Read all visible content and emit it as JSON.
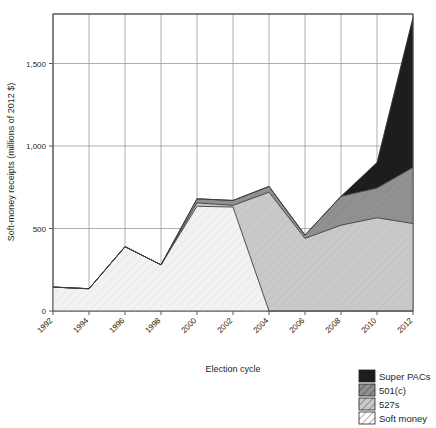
{
  "chart_data": {
    "type": "area",
    "title": "",
    "xlabel": "Election cycle",
    "ylabel": "Soft-money receipts (millions of 2012 $)",
    "categories": [
      "1992",
      "1994",
      "1996",
      "1998",
      "2000",
      "2002",
      "2004",
      "2006",
      "2008",
      "2010",
      "2012"
    ],
    "x": [
      1992,
      1994,
      1996,
      1998,
      2000,
      2002,
      2004,
      2006,
      2008,
      2010,
      2012
    ],
    "xlim": [
      1992,
      2012
    ],
    "ylim": [
      0,
      1800
    ],
    "yticks": [
      0,
      500,
      1000,
      1500
    ],
    "ytick_labels": [
      "0",
      "500",
      "1,000",
      "1,500"
    ],
    "grid": true,
    "stacked": true,
    "legend_position": "bottom-right",
    "series": [
      {
        "name": "Soft money",
        "color": "#eeeeee",
        "pattern": "diagonal-light",
        "values": [
          145,
          135,
          390,
          280,
          635,
          630,
          0,
          0,
          0,
          0,
          0
        ]
      },
      {
        "name": "527s",
        "color": "#c8c8c8",
        "pattern": "diagonal-medium",
        "values": [
          0,
          0,
          0,
          0,
          20,
          10,
          720,
          440,
          520,
          565,
          530
        ]
      },
      {
        "name": "501(c)",
        "color": "#8f8f8f",
        "pattern": "diagonal-dark",
        "values": [
          0,
          0,
          0,
          0,
          25,
          30,
          35,
          20,
          175,
          180,
          340
        ]
      },
      {
        "name": "Super PACs",
        "color": "#1d1d1d",
        "pattern": "solid",
        "values": [
          0,
          0,
          0,
          0,
          0,
          0,
          0,
          0,
          0,
          155,
          910
        ]
      }
    ],
    "stack_tops": {
      "soft_money": [
        145,
        135,
        390,
        280,
        635,
        630,
        0,
        0,
        0,
        0,
        0
      ],
      "plus_527s": [
        145,
        135,
        390,
        280,
        655,
        640,
        720,
        440,
        520,
        565,
        530
      ],
      "plus_501c": [
        145,
        135,
        390,
        280,
        680,
        670,
        755,
        460,
        695,
        745,
        870
      ],
      "plus_superpacs": [
        145,
        135,
        390,
        280,
        680,
        670,
        755,
        460,
        695,
        900,
        1780
      ]
    }
  },
  "axes": {
    "y_label": "Soft-money receipts (millions of 2012 $)",
    "x_label": "Election cycle"
  },
  "legend": {
    "items": [
      {
        "label": "Super PACs",
        "key": "super-pacs"
      },
      {
        "label": "501(c)",
        "key": "501c"
      },
      {
        "label": "527s",
        "key": "527s"
      },
      {
        "label": "Soft money",
        "key": "soft-money"
      }
    ]
  }
}
